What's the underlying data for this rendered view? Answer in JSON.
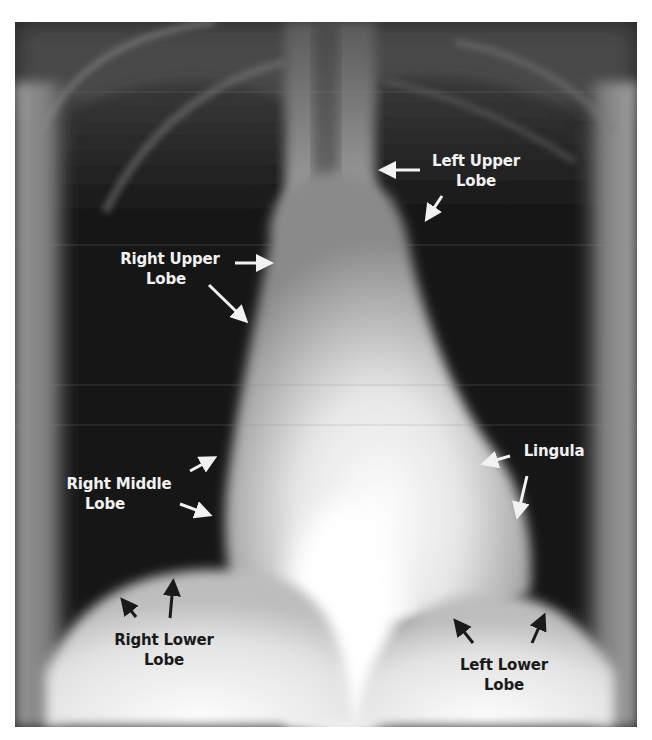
{
  "image": {
    "subject": "Frontal chest X-ray with labeled lung lobes",
    "colors": {
      "background": "#ffffff",
      "light_label": "#f2f2f2",
      "dark_label": "#1a1a1a",
      "lung_field": "#141414",
      "mediastinum": "#e8e8e8"
    }
  },
  "labels": {
    "left_upper_lobe": {
      "line1": "Left Upper",
      "line2": "Lobe",
      "tone": "light"
    },
    "right_upper_lobe": {
      "line1": "Right Upper",
      "line2": "Lobe",
      "tone": "light"
    },
    "right_middle_lobe": {
      "line1": "Right Middle",
      "line2": "Lobe",
      "tone": "light"
    },
    "lingula": {
      "line1": "Lingula",
      "tone": "light"
    },
    "right_lower_lobe": {
      "line1": "Right Lower",
      "line2": "Lobe",
      "tone": "dark"
    },
    "left_lower_lobe": {
      "line1": "Left Lower",
      "line2": "Lobe",
      "tone": "dark"
    }
  },
  "arrows": [
    {
      "name": "left-upper-lobe-arrow-1",
      "from": [
        420,
        170
      ],
      "to": [
        380,
        170
      ],
      "tone": "light"
    },
    {
      "name": "left-upper-lobe-arrow-2",
      "from": [
        442,
        196
      ],
      "to": [
        425,
        221
      ],
      "tone": "light"
    },
    {
      "name": "right-upper-lobe-arrow-1",
      "from": [
        235,
        263
      ],
      "to": [
        272,
        263
      ],
      "tone": "light"
    },
    {
      "name": "right-upper-lobe-arrow-2",
      "from": [
        209,
        285
      ],
      "to": [
        248,
        323
      ],
      "tone": "light"
    },
    {
      "name": "right-middle-lobe-arrow-1",
      "from": [
        190,
        471
      ],
      "to": [
        215,
        457
      ],
      "tone": "light"
    },
    {
      "name": "right-middle-lobe-arrow-2",
      "from": [
        180,
        504
      ],
      "to": [
        211,
        516
      ],
      "tone": "light"
    },
    {
      "name": "lingula-arrow-1",
      "from": [
        510,
        456
      ],
      "to": [
        482,
        464
      ],
      "tone": "light"
    },
    {
      "name": "lingula-arrow-2",
      "from": [
        527,
        476
      ],
      "to": [
        517,
        518
      ],
      "tone": "light"
    },
    {
      "name": "right-lower-lobe-arrow-1",
      "from": [
        136,
        617
      ],
      "to": [
        121,
        598
      ],
      "tone": "dark"
    },
    {
      "name": "right-lower-lobe-arrow-2",
      "from": [
        170,
        618
      ],
      "to": [
        174,
        580
      ],
      "tone": "dark"
    },
    {
      "name": "left-lower-lobe-arrow-1",
      "from": [
        473,
        643
      ],
      "to": [
        454,
        619
      ],
      "tone": "dark"
    },
    {
      "name": "left-lower-lobe-arrow-2",
      "from": [
        532,
        643
      ],
      "to": [
        545,
        614
      ],
      "tone": "dark"
    }
  ]
}
